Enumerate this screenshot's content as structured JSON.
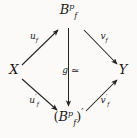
{
  "diagram": {
    "kind": "commutative-diagram",
    "shape": "diamond",
    "background_color": "#fbfaf8",
    "ink_color": "#1d1b1a",
    "nodes": [
      {
        "id": "top",
        "position": "top",
        "base": "B",
        "superscript": "p",
        "subscript": "f",
        "text": "B_f^p"
      },
      {
        "id": "left",
        "position": "left",
        "base": "X",
        "superscript": "",
        "subscript": "",
        "text": "X"
      },
      {
        "id": "right",
        "position": "right",
        "base": "Y",
        "superscript": "",
        "subscript": "",
        "text": "Y"
      },
      {
        "id": "bottom",
        "position": "bottom",
        "open_paren": "(",
        "base": "B",
        "superscript": "p",
        "subscript": "f",
        "close_paren": ")",
        "prime": "′",
        "text": "(B_f^p)'"
      }
    ],
    "edges": [
      {
        "id": "x-to-top",
        "from": "left",
        "to": "top",
        "direction": "up-right",
        "label_base": "u",
        "label_subscript": "f",
        "label_prime": "",
        "label_text": "u_f"
      },
      {
        "id": "top-to-y",
        "from": "top",
        "to": "right",
        "direction": "down-right",
        "label_base": "v",
        "label_subscript": "f",
        "label_prime": "",
        "label_text": "v_f"
      },
      {
        "id": "x-to-bottom",
        "from": "left",
        "to": "bottom",
        "direction": "down-right",
        "label_base": "u",
        "label_subscript": "f",
        "label_prime": "′",
        "label_text": "u'_f"
      },
      {
        "id": "bottom-to-y",
        "from": "bottom",
        "to": "right",
        "direction": "up-right",
        "label_base": "v",
        "label_subscript": "f",
        "label_prime": "′",
        "label_text": "v'_f"
      },
      {
        "id": "top-to-bottom",
        "from": "top",
        "to": "bottom",
        "direction": "down",
        "label_base": "g",
        "label_subscript": "",
        "label_prime": "",
        "label_text": "g",
        "relation_symbol": "≃",
        "relation_meaning": "isomorphic"
      }
    ]
  }
}
